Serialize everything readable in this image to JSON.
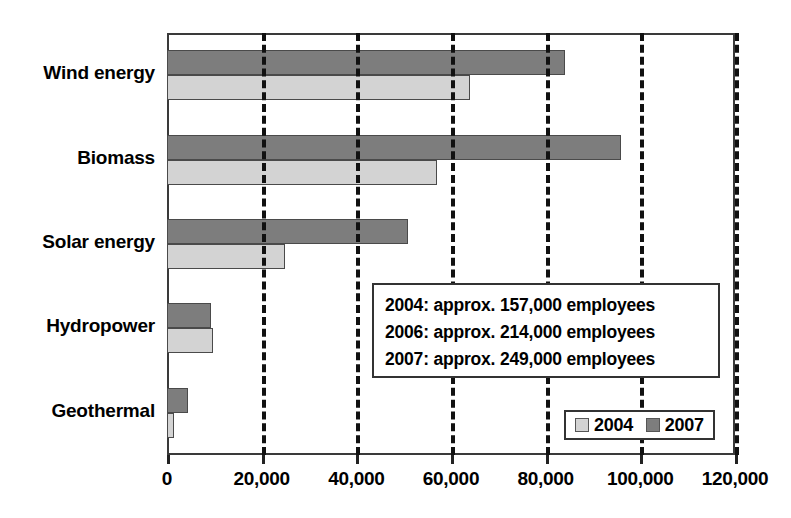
{
  "chart_data": {
    "type": "bar",
    "orientation": "horizontal",
    "title": "",
    "xlabel": "",
    "ylabel": "",
    "categories": [
      "Wind energy",
      "Biomass",
      "Solar energy",
      "Hydropower",
      "Geothermal"
    ],
    "series": [
      {
        "name": "2004",
        "color": "#d3d3d3",
        "values": [
          64000,
          57000,
          25000,
          9700,
          1500
        ]
      },
      {
        "name": "2007",
        "color": "#7d7d7d",
        "values": [
          84000,
          96000,
          51000,
          9300,
          4500
        ]
      }
    ],
    "xlim": [
      0,
      120000
    ],
    "xticks": [
      0,
      20000,
      40000,
      60000,
      80000,
      100000,
      120000
    ],
    "xtick_labels": [
      "0",
      "20,000",
      "40,000",
      "60,000",
      "80,000",
      "100,000",
      "120,000"
    ],
    "grid": true,
    "grid_axis": "x",
    "grid_style": "dashed",
    "legend_position": "bottom-right",
    "legend": [
      "2004",
      "2007"
    ],
    "annotations": [
      "2004: approx. 157,000 employees",
      "2006: approx. 214,000 employees",
      "2007: approx. 249,000 employees"
    ]
  },
  "legend": {
    "items": [
      {
        "label": "2004",
        "color": "#d3d3d3"
      },
      {
        "label": "2007",
        "color": "#7d7d7d"
      }
    ]
  },
  "annotation": {
    "lines": [
      "2004: approx. 157,000 employees",
      "2006: approx. 214,000 employees",
      "2007: approx. 249,000 employees"
    ]
  }
}
